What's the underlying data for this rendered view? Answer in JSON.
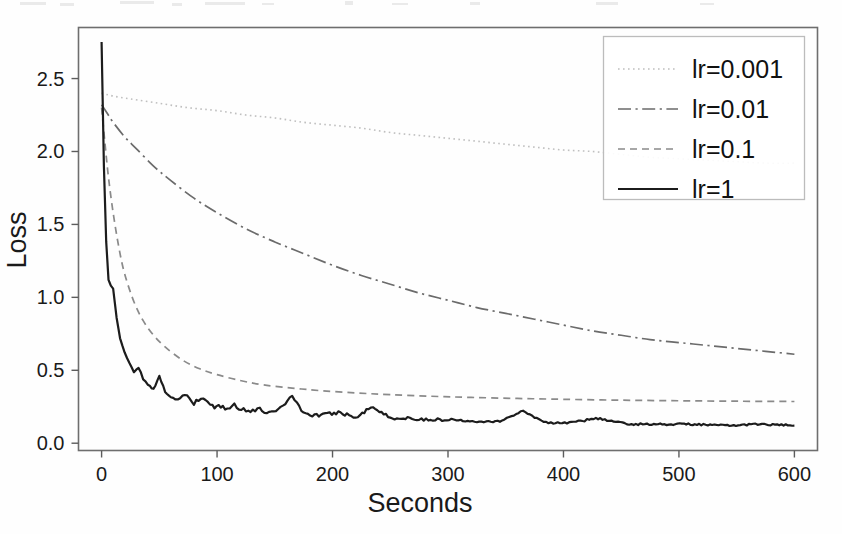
{
  "chart_data": {
    "type": "line",
    "title": "",
    "xlabel": "Seconds",
    "ylabel": "Loss",
    "xlim": [
      -20,
      620
    ],
    "ylim": [
      -0.05,
      2.85
    ],
    "xticks": [
      0,
      100,
      200,
      300,
      400,
      500,
      600
    ],
    "xtick_labels": [
      "0",
      "100",
      "200",
      "300",
      "400",
      "500",
      "600"
    ],
    "yticks": [
      0.0,
      0.5,
      1.0,
      1.5,
      2.0,
      2.5
    ],
    "ytick_labels": [
      "0.0",
      "0.5",
      "1.0",
      "1.5",
      "2.0",
      "2.5"
    ],
    "grid": false,
    "legend_position": "upper right",
    "series": [
      {
        "name": "lr=0.001",
        "linestyle": "dotted",
        "color": "#bfbfbf",
        "x": [
          0,
          10,
          25,
          50,
          75,
          100,
          125,
          150,
          175,
          200,
          225,
          250,
          275,
          300,
          325,
          350,
          375,
          400,
          425,
          450,
          475,
          500,
          525,
          550,
          575,
          600
        ],
        "y": [
          2.4,
          2.38,
          2.36,
          2.33,
          2.3,
          2.28,
          2.25,
          2.23,
          2.2,
          2.18,
          2.16,
          2.13,
          2.11,
          2.09,
          2.07,
          2.05,
          2.03,
          2.01,
          2.0,
          1.98,
          1.96,
          1.95,
          1.94,
          1.93,
          1.92,
          1.92
        ]
      },
      {
        "name": "lr=0.01",
        "linestyle": "dashdot",
        "color": "#6b6b6b",
        "x": [
          0,
          5,
          10,
          20,
          30,
          45,
          60,
          80,
          100,
          125,
          150,
          175,
          200,
          225,
          250,
          275,
          300,
          325,
          350,
          375,
          400,
          425,
          450,
          475,
          500,
          525,
          550,
          575,
          600
        ],
        "y": [
          2.32,
          2.26,
          2.2,
          2.1,
          2.02,
          1.9,
          1.8,
          1.68,
          1.58,
          1.47,
          1.38,
          1.3,
          1.22,
          1.15,
          1.09,
          1.03,
          0.98,
          0.93,
          0.89,
          0.85,
          0.81,
          0.77,
          0.74,
          0.71,
          0.69,
          0.67,
          0.65,
          0.63,
          0.61
        ]
      },
      {
        "name": "lr=0.1",
        "linestyle": "dashed",
        "color": "#8a8a8a",
        "x": [
          0,
          3,
          6,
          10,
          15,
          20,
          28,
          36,
          45,
          55,
          70,
          85,
          100,
          120,
          140,
          165,
          190,
          220,
          250,
          285,
          320,
          360,
          400,
          450,
          500,
          550,
          600
        ],
        "y": [
          2.3,
          2.05,
          1.82,
          1.58,
          1.34,
          1.16,
          0.97,
          0.84,
          0.74,
          0.66,
          0.57,
          0.51,
          0.47,
          0.43,
          0.4,
          0.378,
          0.36,
          0.345,
          0.333,
          0.322,
          0.314,
          0.307,
          0.301,
          0.295,
          0.291,
          0.288,
          0.286
        ]
      },
      {
        "name": "lr=1",
        "linestyle": "solid",
        "color": "#1c1c1c",
        "x": [
          0,
          2,
          4,
          6,
          8,
          10,
          13,
          16,
          20,
          24,
          28,
          32,
          36,
          40,
          45,
          50,
          55,
          60,
          66,
          72,
          80,
          88,
          96,
          105,
          115,
          125,
          135,
          145,
          155,
          165,
          175,
          190,
          205,
          220,
          235,
          250,
          265,
          285,
          305,
          325,
          345,
          365,
          385,
          405,
          430,
          455,
          480,
          510,
          540,
          570,
          600
        ],
        "y": [
          2.75,
          1.9,
          1.38,
          1.12,
          1.08,
          1.06,
          0.86,
          0.72,
          0.62,
          0.55,
          0.49,
          0.52,
          0.44,
          0.4,
          0.37,
          0.47,
          0.34,
          0.31,
          0.3,
          0.33,
          0.27,
          0.31,
          0.25,
          0.24,
          0.26,
          0.22,
          0.23,
          0.21,
          0.24,
          0.33,
          0.2,
          0.19,
          0.21,
          0.18,
          0.25,
          0.17,
          0.17,
          0.16,
          0.16,
          0.15,
          0.15,
          0.22,
          0.14,
          0.14,
          0.17,
          0.13,
          0.13,
          0.13,
          0.12,
          0.13,
          0.12
        ]
      }
    ],
    "annotations": []
  },
  "axes": {
    "x_title": "Seconds",
    "y_title": "Loss"
  },
  "legend": {
    "entries": [
      {
        "label": "lr=0.001",
        "style": "dotted"
      },
      {
        "label": "lr=0.01",
        "style": "dashdot"
      },
      {
        "label": "lr=0.1",
        "style": "dashed"
      },
      {
        "label": "lr=1",
        "style": "solid"
      }
    ]
  }
}
